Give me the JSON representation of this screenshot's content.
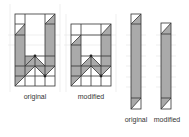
{
  "figure": {
    "panels": [
      {
        "id": "u-original",
        "label": "original",
        "cols": 4,
        "rows": 7
      },
      {
        "id": "u-modified",
        "label": "modified",
        "cols": 4,
        "rows": 6
      },
      {
        "id": "bar-original",
        "label": "original",
        "cols": 1,
        "rows": 9
      },
      {
        "id": "bar-modified",
        "label": "modified",
        "cols": 1,
        "rows": 8
      }
    ],
    "colors": {
      "fill": "#aaaaaa",
      "grid_light": "#dddddd",
      "grid_dark": "#333333",
      "background": "#ffffff"
    }
  }
}
